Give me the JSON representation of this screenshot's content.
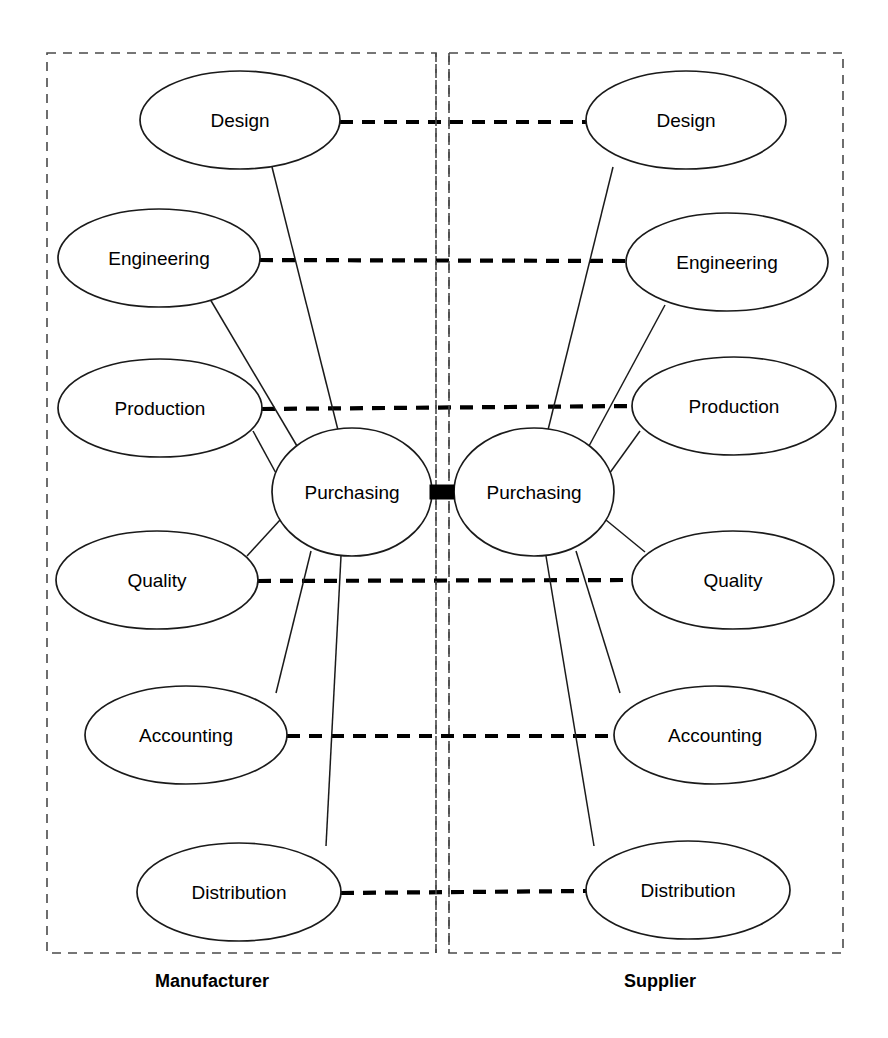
{
  "diagram": {
    "type": "network-diagram",
    "canvas": {
      "width": 888,
      "height": 1038
    },
    "colors": {
      "background": "#ffffff",
      "node_stroke": "#1a1a1a",
      "node_fill": "#ffffff",
      "panel_border": "#4a4a4a",
      "link_color": "#000000",
      "connector_color": "#000000"
    },
    "panels": [
      {
        "id": "manufacturer",
        "caption": "Manufacturer",
        "box": {
          "x": 47,
          "y": 53,
          "width": 389,
          "height": 900
        },
        "caption_pos": {
          "x": 212,
          "y": 981
        },
        "hub": {
          "id": "purchasing-left",
          "label": "Purchasing",
          "cx": 352,
          "cy": 492,
          "rx": 80,
          "ry": 64
        },
        "nodes": [
          {
            "id": "design-left",
            "label": "Design",
            "cx": 240,
            "cy": 120,
            "rx": 100,
            "ry": 49
          },
          {
            "id": "engineering-left",
            "label": "Engineering",
            "cx": 159,
            "cy": 258,
            "rx": 101,
            "ry": 49
          },
          {
            "id": "production-left",
            "label": "Production",
            "cx": 160,
            "cy": 408,
            "rx": 102,
            "ry": 49
          },
          {
            "id": "quality-left",
            "label": "Quality",
            "cx": 157,
            "cy": 580,
            "rx": 101,
            "ry": 49
          },
          {
            "id": "accounting-left",
            "label": "Accounting",
            "cx": 186,
            "cy": 735,
            "rx": 101,
            "ry": 49
          },
          {
            "id": "distribution-left",
            "label": "Distribution",
            "cx": 239,
            "cy": 892,
            "rx": 102,
            "ry": 49
          }
        ]
      },
      {
        "id": "supplier",
        "caption": "Supplier",
        "box": {
          "x": 449,
          "y": 53,
          "width": 394,
          "height": 900
        },
        "caption_pos": {
          "x": 660,
          "y": 981
        },
        "hub": {
          "id": "purchasing-right",
          "label": "Purchasing",
          "cx": 534,
          "cy": 492,
          "rx": 80,
          "ry": 64
        },
        "nodes": [
          {
            "id": "design-right",
            "label": "Design",
            "cx": 686,
            "cy": 120,
            "rx": 100,
            "ry": 49
          },
          {
            "id": "engineering-right",
            "label": "Engineering",
            "cx": 727,
            "cy": 262,
            "rx": 101,
            "ry": 49
          },
          {
            "id": "production-right",
            "label": "Production",
            "cx": 734,
            "cy": 406,
            "rx": 102,
            "ry": 49
          },
          {
            "id": "quality-right",
            "label": "Quality",
            "cx": 733,
            "cy": 580,
            "rx": 101,
            "ry": 49
          },
          {
            "id": "accounting-right",
            "label": "Accounting",
            "cx": 715,
            "cy": 735,
            "rx": 101,
            "ry": 49
          },
          {
            "id": "distribution-right",
            "label": "Distribution",
            "cx": 688,
            "cy": 890,
            "rx": 102,
            "ry": 49
          }
        ]
      }
    ],
    "divider": {
      "left_line_x": 436,
      "right_line_x": 449,
      "y_top": 53,
      "y_bottom": 953
    },
    "hub_connector": {
      "label": "purchasing-to-purchasing-interface",
      "x": 430,
      "y": 485,
      "width": 24,
      "height": 14
    },
    "cross_links": [
      {
        "id": "link-design",
        "label": "Design",
        "from": "design-left",
        "to": "design-right",
        "x1": 340,
        "y1": 122,
        "x2": 586,
        "y2": 122
      },
      {
        "id": "link-engineering",
        "label": "Engineering",
        "from": "engineering-left",
        "to": "engineering-right",
        "x1": 260,
        "y1": 260,
        "x2": 626,
        "y2": 261
      },
      {
        "id": "link-production",
        "label": "Production",
        "from": "production-left",
        "to": "production-right",
        "x1": 262,
        "y1": 409,
        "x2": 632,
        "y2": 406
      },
      {
        "id": "link-quality",
        "label": "Quality",
        "from": "quality-left",
        "to": "quality-right",
        "x1": 258,
        "y1": 581,
        "x2": 632,
        "y2": 580
      },
      {
        "id": "link-accounting",
        "label": "Accounting",
        "from": "accounting-left",
        "to": "accounting-right",
        "x1": 287,
        "y1": 736,
        "x2": 614,
        "y2": 736
      },
      {
        "id": "link-distribution",
        "label": "Distribution",
        "from": "distribution-left",
        "to": "distribution-right",
        "x1": 341,
        "y1": 893,
        "x2": 586,
        "y2": 891
      }
    ],
    "spokes_left": [
      {
        "id": "spoke-left-design",
        "to": "design-left",
        "x1": 339,
        "y1": 434,
        "x2": 272,
        "y2": 167
      },
      {
        "id": "spoke-left-engineering",
        "to": "engineering-left",
        "x1": 297,
        "y1": 446,
        "x2": 210,
        "y2": 299
      },
      {
        "id": "spoke-left-production",
        "to": "production-left",
        "x1": 277,
        "y1": 475,
        "x2": 253,
        "y2": 431
      },
      {
        "id": "spoke-left-quality",
        "to": "quality-left",
        "x1": 280,
        "y1": 520,
        "x2": 247,
        "y2": 556
      },
      {
        "id": "spoke-left-accounting",
        "to": "accounting-left",
        "x1": 311,
        "y1": 551,
        "x2": 276,
        "y2": 693
      },
      {
        "id": "spoke-left-distribution",
        "to": "distribution-left",
        "x1": 341,
        "y1": 556,
        "x2": 326,
        "y2": 846
      }
    ],
    "spokes_right": [
      {
        "id": "spoke-right-design",
        "to": "design-right",
        "x1": 547,
        "y1": 434,
        "x2": 613,
        "y2": 167
      },
      {
        "id": "spoke-right-engineering",
        "to": "engineering-right",
        "x1": 589,
        "y1": 446,
        "x2": 665,
        "y2": 305
      },
      {
        "id": "spoke-right-production",
        "to": "production-right",
        "x1": 609,
        "y1": 474,
        "x2": 640,
        "y2": 431
      },
      {
        "id": "spoke-right-quality",
        "to": "quality-right",
        "x1": 606,
        "y1": 520,
        "x2": 645,
        "y2": 552
      },
      {
        "id": "spoke-right-accounting",
        "to": "accounting-right",
        "x1": 576,
        "y1": 551,
        "x2": 620,
        "y2": 693
      },
      {
        "id": "spoke-right-distribution",
        "to": "distribution-right",
        "x1": 546,
        "y1": 556,
        "x2": 594,
        "y2": 846
      }
    ]
  }
}
